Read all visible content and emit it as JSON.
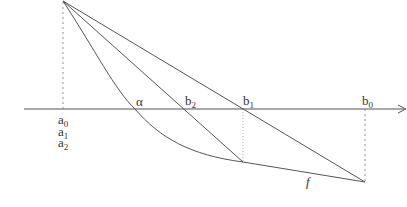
{
  "figure": {
    "axis": {
      "label": "x-axis",
      "arrow": true
    },
    "labels": {
      "a0": {
        "base": "a",
        "sub": "0"
      },
      "a1": {
        "base": "a",
        "sub": "1"
      },
      "a2": {
        "base": "a",
        "sub": "2"
      },
      "alpha": {
        "text": "α"
      },
      "b2": {
        "base": "b",
        "sub": "2"
      },
      "b1": {
        "base": "b",
        "sub": "1"
      },
      "b0": {
        "base": "b",
        "sub": "0"
      },
      "f": {
        "text": "f"
      }
    },
    "colors": {
      "line": "#555555",
      "text": "#333333"
    }
  }
}
